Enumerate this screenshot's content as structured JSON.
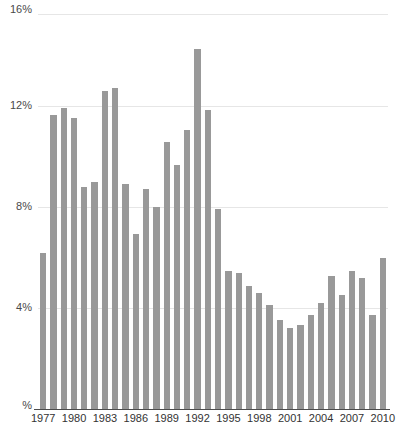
{
  "chart_data": {
    "type": "bar",
    "title": "",
    "subtitle": "",
    "xlabel": "",
    "ylabel": "%",
    "grid": true,
    "legend": null,
    "legend_position": "none",
    "bar_color": "#999999",
    "axis_color": "#4d4d4d",
    "gridline_color": "#e6e6e6",
    "ylim": [
      0,
      16
    ],
    "y_ticks": [
      0,
      4,
      8,
      12,
      16
    ],
    "y_tick_labels": [
      "%",
      "4%",
      "8%",
      "12%",
      "16%"
    ],
    "x_tick_labels": [
      "1977",
      "1980",
      "1983",
      "1986",
      "1989",
      "1992",
      "1995",
      "1998",
      "2001",
      "2004",
      "2007",
      "2010"
    ],
    "x_tick_years": [
      1977,
      1980,
      1983,
      1986,
      1989,
      1992,
      1995,
      1998,
      2001,
      2004,
      2007,
      2010
    ],
    "categories": [
      "1977",
      "1978",
      "1979",
      "1980",
      "1981",
      "1982",
      "1983",
      "1984",
      "1985",
      "1986",
      "1987",
      "1988",
      "1989",
      "1990",
      "1991",
      "1992",
      "1993",
      "1994",
      "1995",
      "1996",
      "1997",
      "1998",
      "1999",
      "2000",
      "2001",
      "2002",
      "2003",
      "2004",
      "2005",
      "2006",
      "2007",
      "2008",
      "2009",
      "2010"
    ],
    "values": [
      6.3,
      11.9,
      12.2,
      11.8,
      9.0,
      9.2,
      12.9,
      13.0,
      9.1,
      7.1,
      8.9,
      8.2,
      10.8,
      9.9,
      11.3,
      14.6,
      12.1,
      8.1,
      5.6,
      5.5,
      5.0,
      4.7,
      4.2,
      3.6,
      3.3,
      3.4,
      3.8,
      4.3,
      5.4,
      4.6,
      5.6,
      5.3,
      3.8,
      6.1
    ],
    "value_unit": "%"
  }
}
